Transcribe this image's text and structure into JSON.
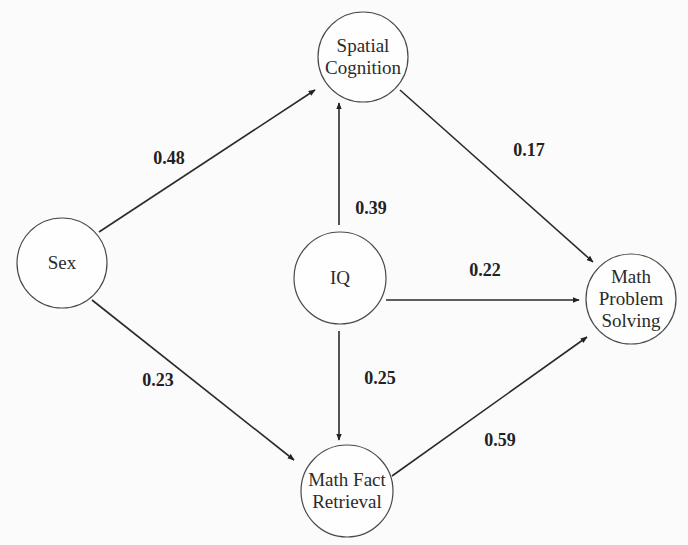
{
  "diagram": {
    "type": "path-model",
    "nodes": [
      {
        "id": "sex",
        "label_lines": [
          "Sex"
        ],
        "cx": 62,
        "cy": 263,
        "r": 45
      },
      {
        "id": "spatial",
        "label_lines": [
          "Spatial",
          "Cognition"
        ],
        "cx": 363,
        "cy": 57,
        "r": 45
      },
      {
        "id": "iq",
        "label_lines": [
          "IQ"
        ],
        "cx": 340,
        "cy": 278,
        "r": 46
      },
      {
        "id": "mfr",
        "label_lines": [
          "Math Fact",
          "Retrieval"
        ],
        "cx": 347,
        "cy": 491,
        "r": 46
      },
      {
        "id": "mps",
        "label_lines": [
          "Math",
          "Problem",
          "Solving"
        ],
        "cx": 631,
        "cy": 299,
        "r": 45
      }
    ],
    "edges": [
      {
        "from": "sex",
        "to": "spatial",
        "coefficient": "0.48",
        "x1": 99,
        "y1": 232,
        "x2": 315,
        "y2": 90,
        "lx": 169,
        "ly": 164
      },
      {
        "from": "iq",
        "to": "spatial",
        "coefficient": "0.39",
        "x1": 339,
        "y1": 225,
        "x2": 339,
        "y2": 103,
        "lx": 371,
        "ly": 214
      },
      {
        "from": "spatial",
        "to": "mps",
        "coefficient": "0.17",
        "x1": 400,
        "y1": 90,
        "x2": 593,
        "y2": 262,
        "lx": 529,
        "ly": 156
      },
      {
        "from": "iq",
        "to": "mps",
        "coefficient": "0.22",
        "x1": 386,
        "y1": 300,
        "x2": 579,
        "y2": 300,
        "lx": 485,
        "ly": 276
      },
      {
        "from": "sex",
        "to": "mfr",
        "coefficient": "0.23",
        "x1": 92,
        "y1": 300,
        "x2": 294,
        "y2": 460,
        "lx": 158,
        "ly": 386
      },
      {
        "from": "iq",
        "to": "mfr",
        "coefficient": "0.25",
        "x1": 339,
        "y1": 331,
        "x2": 339,
        "y2": 440,
        "lx": 380,
        "ly": 384
      },
      {
        "from": "mfr",
        "to": "mps",
        "coefficient": "0.59",
        "x1": 392,
        "y1": 476,
        "x2": 587,
        "y2": 337,
        "lx": 500,
        "ly": 446
      }
    ]
  },
  "colors": {
    "background": "#fbfbfb",
    "stroke": "#2a2a2a",
    "text": "#2b2b2b"
  }
}
